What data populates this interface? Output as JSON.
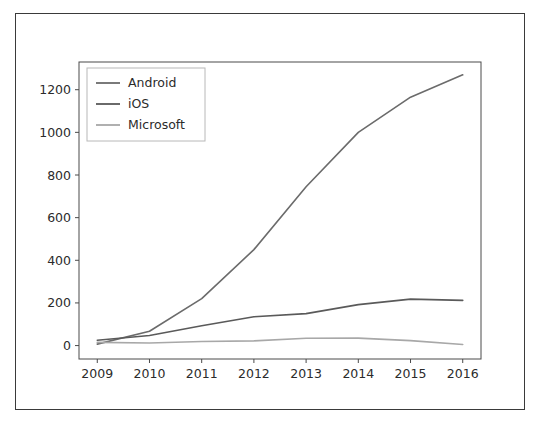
{
  "figure": {
    "border_color": "#3a3a3a",
    "background": "#ffffff"
  },
  "chart_data": {
    "type": "line",
    "title": "",
    "xlabel": "",
    "ylabel": "",
    "x": [
      2009,
      2010,
      2011,
      2012,
      2013,
      2014,
      2015,
      2016
    ],
    "categories": [
      "2009",
      "2010",
      "2011",
      "2012",
      "2013",
      "2014",
      "2015",
      "2016"
    ],
    "series": [
      {
        "name": "Android",
        "color": "#6b6b6b",
        "values": [
          6.8,
          67,
          220,
          450,
          745,
          1000,
          1165,
          1270
        ]
      },
      {
        "name": "iOS",
        "color": "#5a5a5a",
        "values": [
          25,
          47,
          93,
          135,
          150,
          192,
          218,
          212
        ]
      },
      {
        "name": "Microsoft",
        "color": "#a8a8a8",
        "values": [
          15,
          12,
          19,
          22,
          34,
          35,
          23,
          5
        ]
      }
    ],
    "xlim": [
      2008.65,
      2016.35
    ],
    "ylim": [
      -63,
      1330
    ],
    "yticks": [
      0,
      200,
      400,
      600,
      800,
      1000,
      1200
    ],
    "ytick_labels": [
      "0",
      "200",
      "400",
      "600",
      "800",
      "1000",
      "1200"
    ],
    "xticks": [
      2009,
      2010,
      2011,
      2012,
      2013,
      2014,
      2015,
      2016
    ],
    "xtick_labels": [
      "2009",
      "2010",
      "2011",
      "2012",
      "2013",
      "2014",
      "2015",
      "2016"
    ],
    "grid": false,
    "legend_position": "upper left",
    "legend_entries": [
      "Android",
      "iOS",
      "Microsoft"
    ]
  }
}
